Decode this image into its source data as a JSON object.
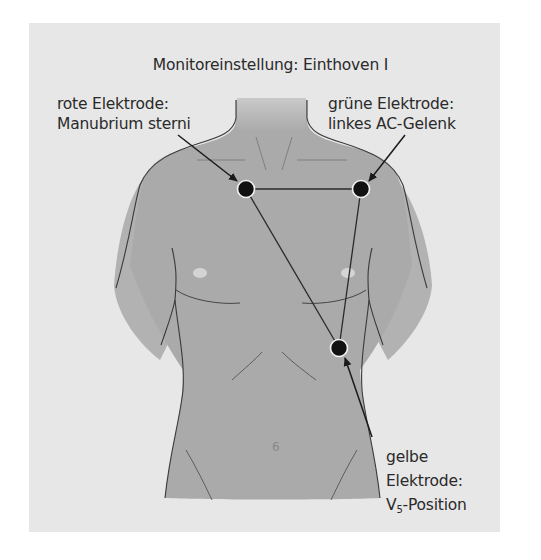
{
  "title": "Monitoreinstellung: Einthoven I",
  "electrodes": {
    "red": {
      "line1": "rote Elektrode:",
      "line2": "Manubrium sterni",
      "position": [
        246,
        189
      ]
    },
    "green": {
      "line1": "grüne Elektrode:",
      "line2": "linkes AC-Gelenk",
      "position": [
        361,
        189
      ]
    },
    "yellow": {
      "line1": "gelbe",
      "line2": "Elektrode:",
      "line3_prefix": "V",
      "line3_sub": "5",
      "line3_suffix": "-Position",
      "position": [
        339,
        348
      ]
    }
  },
  "colors": {
    "panel": "#e7e7e7",
    "torso": "#a9a9a9",
    "outline": "#3a3a3a",
    "electrode": "#111111",
    "text": "#2a2a2a"
  }
}
